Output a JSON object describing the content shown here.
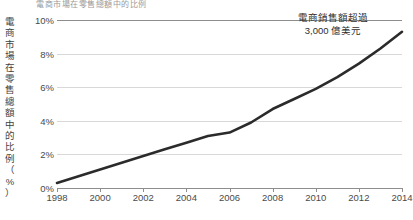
{
  "title_strip": "電商市場在零售總額中的比例",
  "axis": {
    "y_caption": "電商市場在零售總額中的比例（%）",
    "y_caption_chars": [
      "電",
      "商",
      "市",
      "場",
      "在",
      "零",
      "售",
      "總",
      "額",
      "中",
      "的",
      "比",
      "例",
      "（",
      "%",
      "）"
    ],
    "y_ticks": [
      "0%",
      "2%",
      "4%",
      "6%",
      "8%",
      "10%"
    ],
    "x_ticks": [
      "1998",
      "2000",
      "2002",
      "2004",
      "2006",
      "2008",
      "2010",
      "2012",
      "2014"
    ]
  },
  "annotation": {
    "line1": "電商銷售額超過",
    "line2": "3,000 億美元"
  },
  "colors": {
    "line": "#2b2b2b",
    "grid": "#d8d8d8",
    "axis": "#8e8e8e",
    "text": "#3a3a3a",
    "background": "#ffffff"
  },
  "chart_data": {
    "type": "line",
    "title": "電商市場在零售總額中的比例",
    "xlabel": "",
    "ylabel": "電商市場在零售總額中的比例（%）",
    "xlim": [
      1998,
      2014
    ],
    "ylim": [
      0,
      10
    ],
    "ytick_values": [
      0,
      2,
      4,
      6,
      8,
      10
    ],
    "xtick_values": [
      1998,
      2000,
      2002,
      2004,
      2006,
      2008,
      2010,
      2012,
      2014
    ],
    "grid": true,
    "legend": "none",
    "series": [
      {
        "name": "電商市場在零售總額中的比例",
        "color": "#2b2b2b",
        "x": [
          1998,
          1999,
          2000,
          2001,
          2002,
          2003,
          2004,
          2005,
          2006,
          2007,
          2008,
          2009,
          2010,
          2011,
          2012,
          2013,
          2014
        ],
        "values": [
          0.3,
          0.7,
          1.1,
          1.5,
          1.9,
          2.3,
          2.7,
          3.1,
          3.3,
          3.9,
          4.7,
          5.3,
          5.9,
          6.6,
          7.4,
          8.3,
          9.3
        ]
      }
    ],
    "annotations": [
      {
        "text": "電商銷售額超過 3,000 億美元",
        "x": 2012,
        "y": 9.6
      }
    ]
  }
}
